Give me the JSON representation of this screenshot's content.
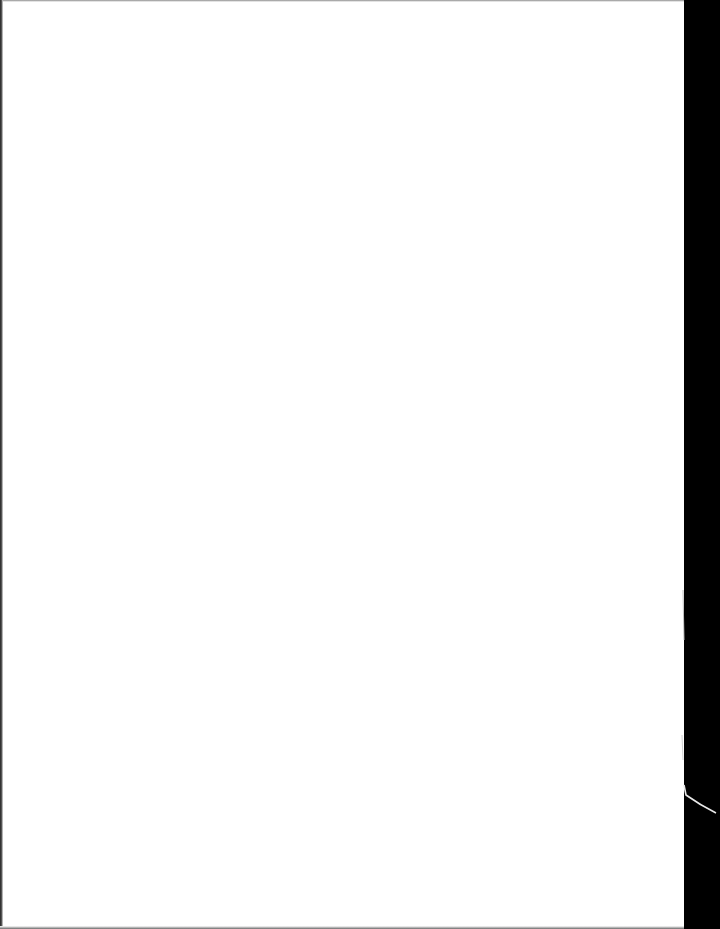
{
  "document": {
    "type": "scanned-page",
    "state": "blank",
    "text": "",
    "colors": {
      "paper": "#ffffff",
      "scan_background": "#000000",
      "edge_shadow": "#3a3a3a"
    }
  }
}
